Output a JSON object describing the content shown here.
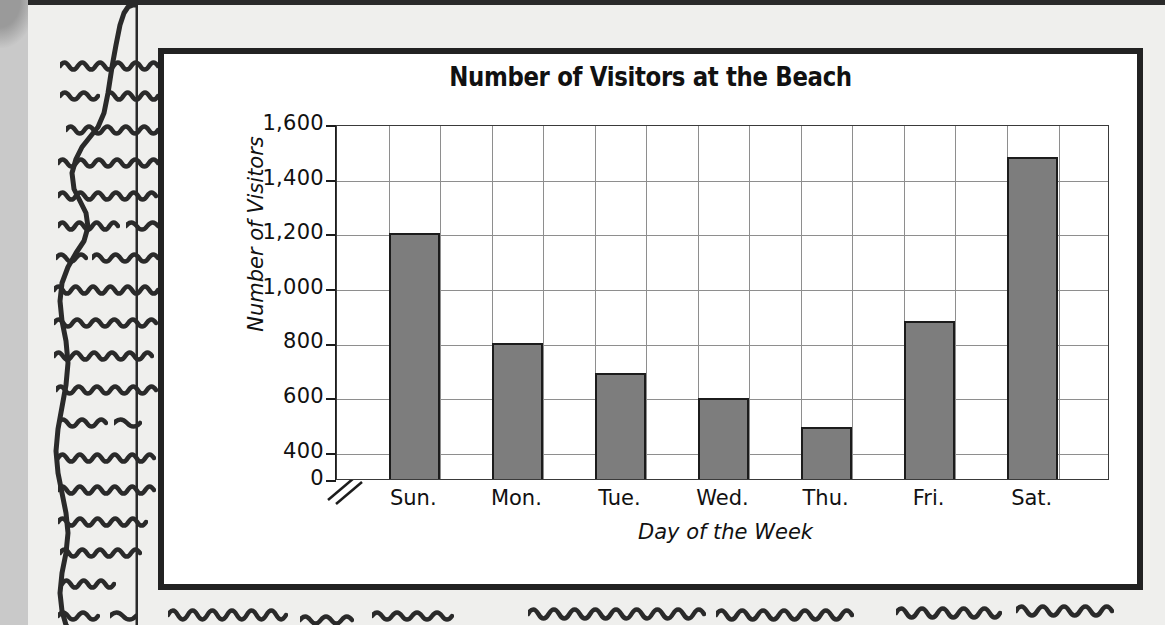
{
  "worksheet": {
    "background_color": "#c9c9c9",
    "paper_color": "#efefed",
    "ink_color": "#2a2a2a",
    "scribble_lines": [
      {
        "x": 60,
        "y": 58,
        "w": 98,
        "amp": 4,
        "n": 11
      },
      {
        "x": 60,
        "y": 88,
        "w": 38,
        "amp": 4,
        "n": 4
      },
      {
        "x": 106,
        "y": 88,
        "w": 52,
        "amp": 4,
        "n": 6
      },
      {
        "x": 66,
        "y": 122,
        "w": 92,
        "amp": 4,
        "n": 10
      },
      {
        "x": 58,
        "y": 155,
        "w": 100,
        "amp": 4,
        "n": 11
      },
      {
        "x": 58,
        "y": 188,
        "w": 98,
        "amp": 4,
        "n": 11
      },
      {
        "x": 58,
        "y": 218,
        "w": 60,
        "amp": 4,
        "n": 7
      },
      {
        "x": 126,
        "y": 218,
        "w": 32,
        "amp": 4,
        "n": 3
      },
      {
        "x": 56,
        "y": 250,
        "w": 30,
        "amp": 4,
        "n": 3
      },
      {
        "x": 92,
        "y": 250,
        "w": 66,
        "amp": 4,
        "n": 7
      },
      {
        "x": 54,
        "y": 282,
        "w": 104,
        "amp": 4,
        "n": 12
      },
      {
        "x": 54,
        "y": 315,
        "w": 102,
        "amp": 4,
        "n": 11
      },
      {
        "x": 54,
        "y": 348,
        "w": 98,
        "amp": 4,
        "n": 11
      },
      {
        "x": 56,
        "y": 382,
        "w": 100,
        "amp": 4,
        "n": 11
      },
      {
        "x": 58,
        "y": 415,
        "w": 48,
        "amp": 4,
        "n": 5
      },
      {
        "x": 114,
        "y": 415,
        "w": 26,
        "amp": 4,
        "n": 2
      },
      {
        "x": 58,
        "y": 450,
        "w": 96,
        "amp": 4,
        "n": 11
      },
      {
        "x": 58,
        "y": 482,
        "w": 96,
        "amp": 4,
        "n": 11
      },
      {
        "x": 58,
        "y": 514,
        "w": 88,
        "amp": 4,
        "n": 10
      },
      {
        "x": 60,
        "y": 545,
        "w": 80,
        "amp": 4,
        "n": 9
      },
      {
        "x": 62,
        "y": 576,
        "w": 52,
        "amp": 4,
        "n": 6
      },
      {
        "x": 58,
        "y": 608,
        "w": 40,
        "amp": 4,
        "n": 4
      },
      {
        "x": 110,
        "y": 608,
        "w": 26,
        "amp": 4,
        "n": 2
      },
      {
        "x": 168,
        "y": 606,
        "w": 118,
        "amp": 5,
        "n": 12
      },
      {
        "x": 300,
        "y": 612,
        "w": 52,
        "amp": 4,
        "n": 5
      },
      {
        "x": 372,
        "y": 608,
        "w": 80,
        "amp": 4,
        "n": 8
      },
      {
        "x": 528,
        "y": 605,
        "w": 176,
        "amp": 5,
        "n": 17
      },
      {
        "x": 716,
        "y": 606,
        "w": 136,
        "amp": 5,
        "n": 13
      },
      {
        "x": 896,
        "y": 604,
        "w": 104,
        "amp": 5,
        "n": 10
      },
      {
        "x": 1016,
        "y": 602,
        "w": 96,
        "amp": 5,
        "n": 9
      }
    ]
  },
  "chart_data": {
    "type": "bar",
    "title": "Number of Visitors at the Beach",
    "xlabel": "Day of the Week",
    "ylabel": "Number of Visitors",
    "categories": [
      "Sun.",
      "Mon.",
      "Tue.",
      "Wed.",
      "Thu.",
      "Fri.",
      "Sat."
    ],
    "values": [
      1200,
      800,
      690,
      595,
      490,
      880,
      1480
    ],
    "ytick_labels": [
      "0",
      "400",
      "600",
      "800",
      "1,000",
      "1,200",
      "1,400",
      "1,600"
    ],
    "ytick_values": [
      0,
      400,
      600,
      800,
      1000,
      1200,
      1400,
      1600
    ],
    "ylim": [
      0,
      1600
    ],
    "axis_break": true,
    "axis_break_between": [
      0,
      400
    ],
    "grid": true,
    "grid_vertical": true,
    "grid_horizontal": true,
    "legend": false,
    "bar_fill_color": "#7d7d7d",
    "bar_edge_color": "#1c1c1c",
    "grid_color": "#8e8e8e",
    "plot_background": "#ffffff"
  }
}
